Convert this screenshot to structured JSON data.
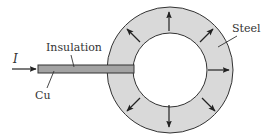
{
  "diagram": {
    "type": "cross-section",
    "labels": {
      "current": "I",
      "insulation": "Insulation",
      "conductor": "Cu",
      "casing": "Steel"
    },
    "colors": {
      "background": "#ffffff",
      "steel_ring": "#d9d9d9",
      "conductor_bar": "#a3a3a3",
      "outline": "#333333",
      "inner_bore": "#ffffff"
    },
    "geometry": {
      "ring_center": [
        170,
        70
      ],
      "outer_radius": 63,
      "inner_radius": 37,
      "bar": {
        "x": 38,
        "y": 65,
        "width": 96,
        "height": 8
      }
    },
    "radial_arrows": [
      {
        "direction": "up",
        "angle_deg": 270
      },
      {
        "direction": "up-left",
        "angle_deg": 225
      },
      {
        "direction": "up-right",
        "angle_deg": 315
      },
      {
        "direction": "right",
        "angle_deg": 0
      },
      {
        "direction": "down-right",
        "angle_deg": 45
      },
      {
        "direction": "down",
        "angle_deg": 90
      },
      {
        "direction": "down-left",
        "angle_deg": 135
      }
    ]
  }
}
